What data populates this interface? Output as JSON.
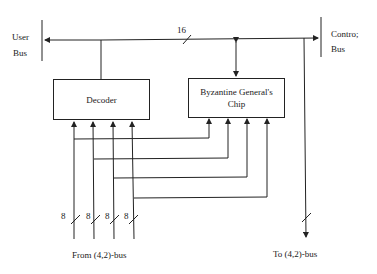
{
  "labels": {
    "user_bus_line1": "User",
    "user_bus_line2": "Bus",
    "control_bus_line1": "Contro;",
    "control_bus_line2": "Bus",
    "bus_width": "16",
    "from_bus": "From (4,2)-bus",
    "to_bus": "To (4,2)-bus"
  },
  "blocks": {
    "decoder": "Decoder",
    "bg_chip_line1": "Byzantine General's",
    "bg_chip_line2": "Chip"
  },
  "input_widths": [
    "8",
    "8",
    "8",
    "8"
  ],
  "colors": {
    "line": "#222222",
    "background": "#ffffff"
  }
}
